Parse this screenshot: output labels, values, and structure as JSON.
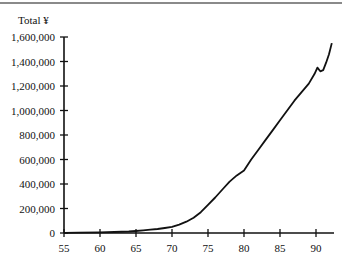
{
  "chart_data": {
    "type": "line",
    "title": "",
    "ylabel": "Total ¥",
    "xlabel": "",
    "xlim": [
      55,
      93
    ],
    "ylim": [
      0,
      1600000
    ],
    "grid": false,
    "legend": null,
    "x_ticks": [
      55,
      60,
      65,
      70,
      75,
      80,
      85,
      90
    ],
    "x_tick_labels": [
      "55",
      "60",
      "65",
      "70",
      "75",
      "80",
      "85",
      "90"
    ],
    "y_ticks": [
      0,
      200000,
      400000,
      600000,
      800000,
      1000000,
      1200000,
      1400000,
      1600000
    ],
    "y_tick_labels": [
      "0",
      "200,000",
      "400,000",
      "600,000",
      "800,000",
      "1,000,000",
      "1,200,000",
      "1,400,000",
      "1,600,000"
    ],
    "series": [
      {
        "name": "Total ¥",
        "x": [
          55,
          57,
          60,
          62,
          64,
          65,
          66,
          67,
          68,
          69,
          70,
          71,
          72,
          73,
          74,
          75,
          76,
          77,
          78,
          79,
          80,
          81,
          82,
          83,
          84,
          85,
          86,
          87,
          88,
          89,
          89.8,
          90.2,
          90.6,
          91,
          91.4,
          91.8,
          92.2
        ],
        "values": [
          2000,
          3000,
          5000,
          8000,
          12000,
          16000,
          21000,
          27000,
          33000,
          41000,
          50000,
          68000,
          92000,
          125000,
          170000,
          230000,
          290000,
          355000,
          420000,
          470000,
          510000,
          600000,
          680000,
          760000,
          840000,
          920000,
          1000000,
          1080000,
          1150000,
          1220000,
          1300000,
          1350000,
          1320000,
          1330000,
          1390000,
          1460000,
          1550000
        ]
      }
    ]
  }
}
